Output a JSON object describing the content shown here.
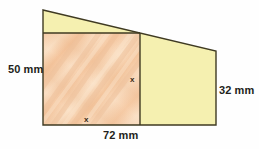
{
  "figure": {
    "kind": "geometry-diagram",
    "canvas": {
      "width": 259,
      "height": 149
    },
    "background_color": "#fefefe",
    "colors": {
      "square_fill": "#f6c9a4",
      "square_fill_light": "#fbe0c4",
      "trapezoid_fill": "#f5f0b0",
      "outline": "#3f3a22",
      "label_text": "#231f20",
      "variable_text": "#3a2a14"
    },
    "shapes": {
      "trapezoid": {
        "name": "outer-trapezoid",
        "fill": "#f5f0b0",
        "points": "43,10 216,51 216,125 43,125"
      },
      "square": {
        "name": "inscribed-square",
        "fill": "#f6c9a4",
        "x": 43,
        "y": 33,
        "width": 97,
        "height": 92
      }
    },
    "labels": {
      "left_height": "50 mm",
      "right_height": "32 mm",
      "base_width": "72 mm",
      "square_side_vertical": "x",
      "square_side_horizontal": "x"
    }
  }
}
